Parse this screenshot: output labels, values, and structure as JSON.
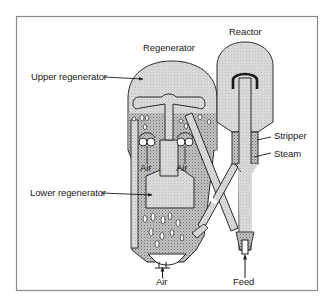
{
  "figure": {
    "type": "fluid catalytic cracking unit schematic",
    "frame": {
      "x": 16,
      "y": 16,
      "width": 302,
      "height": 275,
      "border_color": "#8a8a8a"
    },
    "colors": {
      "vessel_fill": "#d9d9d9",
      "fluid_bed_fill": "#bdbdbd",
      "outline": "#2a2a2a",
      "bubble": "#ffffff"
    }
  },
  "labels": {
    "regenerator": "Regenerator",
    "reactor": "Reactor",
    "upper_regenerator": "Upper regenerator",
    "lower_regenerator": "Lower regenerator",
    "stripper": "Stripper",
    "steam": "Steam",
    "air_left": "Air",
    "air_right": "Air",
    "air_bottom": "Air",
    "feed": "Feed"
  },
  "components": [
    {
      "name": "Regenerator",
      "parts": [
        "Upper regenerator",
        "Lower regenerator"
      ]
    },
    {
      "name": "Reactor",
      "parts": [
        "Stripper"
      ]
    },
    {
      "name": "Inputs",
      "parts": [
        "Air",
        "Air",
        "Air",
        "Steam",
        "Feed"
      ]
    }
  ]
}
